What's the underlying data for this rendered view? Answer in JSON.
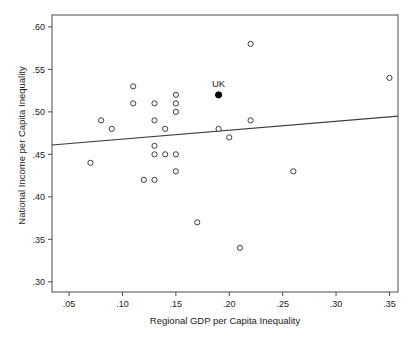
{
  "figure": {
    "cut_header_text": "",
    "x_axis": {
      "label": "Regional GDP per Capita Inequality",
      "ticks": [
        ".05",
        ".10",
        ".15",
        ".20",
        ".25",
        ".30",
        ".35"
      ],
      "tick_values": [
        0.05,
        0.1,
        0.15,
        0.2,
        0.25,
        0.3,
        0.35
      ],
      "min": 0.034,
      "max": 0.358
    },
    "y_axis": {
      "label": "National Income per Capita Inequality",
      "ticks": [
        ".30",
        ".35",
        ".40",
        ".45",
        ".50",
        ".55",
        ".60"
      ],
      "tick_values": [
        0.3,
        0.35,
        0.4,
        0.45,
        0.5,
        0.55,
        0.6
      ],
      "min": 0.288,
      "max": 0.614
    },
    "annotation": {
      "uk_label": "UK"
    },
    "colors": {
      "frame": "#4a4a4a",
      "marker_stroke": "#3c3c3c",
      "marker_fill": "#ffffff",
      "highlight_fill": "#000000",
      "fit_line": "#3c3c3c",
      "text": "#1a1a1a"
    }
  },
  "chart_data": {
    "type": "scatter",
    "title": "",
    "xlabel": "Regional GDP per Capita Inequality",
    "ylabel": "National Income per Capita Inequality",
    "xlim": [
      0.034,
      0.358
    ],
    "ylim": [
      0.288,
      0.614
    ],
    "grid": false,
    "legend": null,
    "series": [
      {
        "name": "Countries",
        "marker": "open-circle",
        "points": [
          {
            "x": 0.07,
            "y": 0.44
          },
          {
            "x": 0.08,
            "y": 0.49
          },
          {
            "x": 0.09,
            "y": 0.48
          },
          {
            "x": 0.11,
            "y": 0.53
          },
          {
            "x": 0.11,
            "y": 0.51
          },
          {
            "x": 0.12,
            "y": 0.42
          },
          {
            "x": 0.13,
            "y": 0.51
          },
          {
            "x": 0.13,
            "y": 0.49
          },
          {
            "x": 0.13,
            "y": 0.46
          },
          {
            "x": 0.13,
            "y": 0.45
          },
          {
            "x": 0.13,
            "y": 0.42
          },
          {
            "x": 0.14,
            "y": 0.48
          },
          {
            "x": 0.14,
            "y": 0.45
          },
          {
            "x": 0.15,
            "y": 0.52
          },
          {
            "x": 0.15,
            "y": 0.51
          },
          {
            "x": 0.15,
            "y": 0.5
          },
          {
            "x": 0.15,
            "y": 0.45
          },
          {
            "x": 0.15,
            "y": 0.43
          },
          {
            "x": 0.17,
            "y": 0.37
          },
          {
            "x": 0.19,
            "y": 0.48
          },
          {
            "x": 0.2,
            "y": 0.47
          },
          {
            "x": 0.21,
            "y": 0.34
          },
          {
            "x": 0.22,
            "y": 0.58
          },
          {
            "x": 0.22,
            "y": 0.49
          },
          {
            "x": 0.26,
            "y": 0.43
          },
          {
            "x": 0.35,
            "y": 0.54
          }
        ]
      },
      {
        "name": "UK",
        "marker": "filled-circle",
        "points": [
          {
            "x": 0.19,
            "y": 0.52,
            "label": "UK"
          }
        ]
      }
    ],
    "fit_line": {
      "type": "linear",
      "x_start": 0.034,
      "y_start": 0.461,
      "x_end": 0.358,
      "y_end": 0.495
    }
  }
}
